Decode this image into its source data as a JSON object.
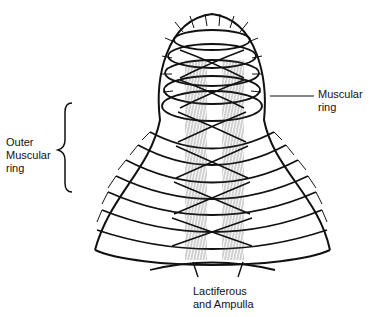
{
  "figure": {
    "type": "anatomical illustration",
    "labels": {
      "outer_muscular_ring": [
        "Outer",
        "Muscular",
        "ring"
      ],
      "muscular_ring": [
        "Muscular",
        "ring"
      ],
      "lactiferous": [
        "Lactiferous",
        "and Ampulla"
      ]
    },
    "colors": {
      "ink": "#111111",
      "background": "#ffffff",
      "hatch": "#555555"
    }
  }
}
